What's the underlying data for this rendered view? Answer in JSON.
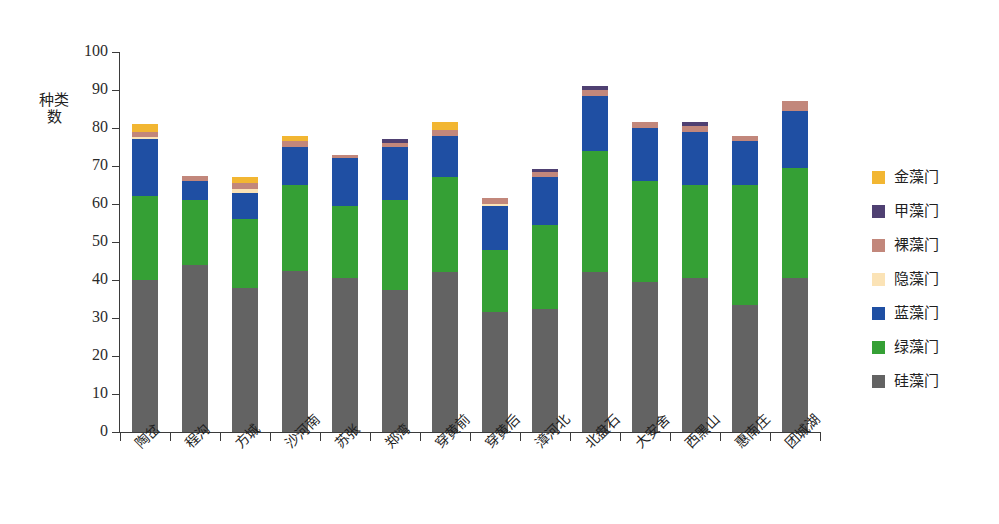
{
  "chart_data": {
    "type": "bar",
    "subtype": "stacked-bar",
    "title": "",
    "xlabel": "",
    "ylabel": "种类数",
    "ylim": [
      0,
      100
    ],
    "yticks": [
      0,
      10,
      20,
      30,
      40,
      50,
      60,
      70,
      80,
      90,
      100
    ],
    "ytick_labels": [
      "0",
      "10",
      "20",
      "30",
      "40",
      "50",
      "60",
      "70",
      "80",
      "90",
      "100"
    ],
    "grid": false,
    "legend_position": "right",
    "categories": [
      "陶岔",
      "程沟",
      "方城",
      "沙河南",
      "苏张",
      "郑湾",
      "穿黄前",
      "穿黄后",
      "漳河北",
      "北盘石",
      "大安舍",
      "西黑山",
      "惠南庄",
      "团城湖"
    ],
    "series": [
      {
        "name": "硅藻门",
        "color": "#636363",
        "values": [
          40.0,
          44.0,
          38.0,
          42.5,
          40.5,
          37.5,
          42.0,
          31.5,
          32.5,
          42.0,
          39.5,
          40.5,
          33.5,
          40.5
        ]
      },
      {
        "name": "绿藻门",
        "color": "#35a035",
        "values": [
          22.0,
          17.0,
          18.0,
          22.5,
          19.0,
          23.5,
          25.0,
          16.5,
          22.0,
          32.0,
          26.5,
          24.5,
          31.5,
          29.0
        ]
      },
      {
        "name": "蓝藻门",
        "color": "#1f4fa3",
        "values": [
          15.0,
          5.0,
          7.0,
          10.0,
          12.5,
          14.0,
          11.0,
          11.5,
          12.5,
          14.5,
          14.0,
          14.0,
          11.5,
          15.0
        ]
      },
      {
        "name": "隐藻门",
        "color": "#fbe3b6",
        "values": [
          0.6,
          0.0,
          1.0,
          0.0,
          0.0,
          0.0,
          0.0,
          0.6,
          0.0,
          0.0,
          0.0,
          0.0,
          0.0,
          0.0
        ]
      },
      {
        "name": "裸藻门",
        "color": "#c2877b",
        "values": [
          1.4,
          1.3,
          1.5,
          1.5,
          1.0,
          1.0,
          1.5,
          1.4,
          1.5,
          1.5,
          1.5,
          1.5,
          1.5,
          2.5
        ]
      },
      {
        "name": "甲藻门",
        "color": "#4f4072",
        "values": [
          0.0,
          0.0,
          0.0,
          0.0,
          0.0,
          1.0,
          0.0,
          0.0,
          0.6,
          1.0,
          0.0,
          1.0,
          0.0,
          0.0
        ]
      },
      {
        "name": "金藻门",
        "color": "#f2b632",
        "values": [
          2.0,
          0.0,
          1.5,
          1.5,
          0.0,
          0.0,
          2.0,
          0.0,
          0.0,
          0.0,
          0.0,
          0.0,
          0.0,
          0.0
        ]
      }
    ],
    "stack_order_bottom_to_top": [
      "硅藻门",
      "绿藻门",
      "蓝藻门",
      "隐藻门",
      "裸藻门",
      "甲藻门",
      "金藻门"
    ],
    "totals": [
      81.0,
      67.3,
      67.0,
      78.0,
      73.0,
      77.0,
      81.5,
      61.5,
      69.1,
      91.0,
      81.5,
      81.5,
      78.0,
      87.0
    ]
  },
  "legend": {
    "items": [
      {
        "label": "金藻门",
        "color": "#f2b632"
      },
      {
        "label": "甲藻门",
        "color": "#4f4072"
      },
      {
        "label": "裸藻门",
        "color": "#c2877b"
      },
      {
        "label": "隐藻门",
        "color": "#fbe3b6"
      },
      {
        "label": "蓝藻门",
        "color": "#1f4fa3"
      },
      {
        "label": "绿藻门",
        "color": "#35a035"
      },
      {
        "label": "硅藻门",
        "color": "#636363"
      }
    ]
  },
  "axes": {
    "y_title": "种类数",
    "axis_color": "#3b3b3b"
  }
}
